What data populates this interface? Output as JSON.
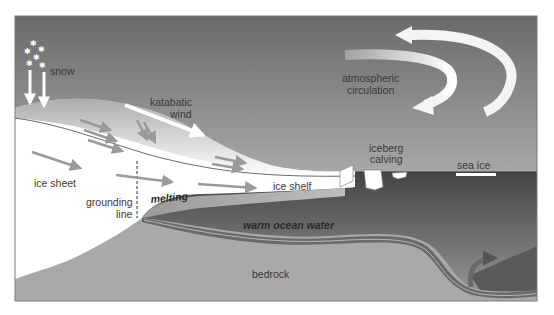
{
  "diagram": {
    "labels": {
      "snow": "snow",
      "katabatic_1": "katabatic",
      "katabatic_2": "wind",
      "atmos_1": "atmospheric",
      "atmos_2": "circulation",
      "ice_sheet": "ice sheet",
      "grounding_1": "grounding",
      "grounding_2": "line",
      "melting": "melting",
      "ice_shelf": "ice shelf",
      "iceberg_1": "iceberg",
      "iceberg_2": "calving",
      "sea_ice": "sea ice",
      "warm_ocean": "warm ocean water",
      "bedrock": "bedrock"
    },
    "colors": {
      "sky_top": "#6e6e6e",
      "sky_bottom": "#e6e6e6",
      "ice": "#ffffff",
      "ocean_top": "#4a4a4a",
      "ocean_bottom": "#8c8c8c",
      "warm_water": "#6a6a6a",
      "bedrock": "#a8a8a8",
      "flow_arrow": "#9a9a9a",
      "frame": "#7a7a7a"
    }
  }
}
